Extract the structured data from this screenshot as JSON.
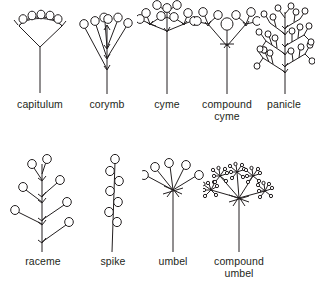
{
  "figure": {
    "background_color": "#ffffff",
    "ink_color": "#231f20",
    "rows": [
      {
        "row_name": "top-row",
        "items": [
          {
            "id": "capitulum",
            "label": "capitulum",
            "icon": "capitulum-diagram",
            "label_lines": 1
          },
          {
            "id": "corymb",
            "label": "corymb",
            "icon": "corymb-diagram",
            "label_lines": 1
          },
          {
            "id": "cyme",
            "label": "cyme",
            "icon": "cyme-diagram",
            "label_lines": 1
          },
          {
            "id": "compound-cyme",
            "label": "compound\ncyme",
            "icon": "compound-cyme-diagram",
            "label_lines": 2
          },
          {
            "id": "panicle",
            "label": "panicle",
            "icon": "panicle-diagram",
            "label_lines": 1
          }
        ]
      },
      {
        "row_name": "bottom-row",
        "items": [
          {
            "id": "raceme",
            "label": "raceme",
            "icon": "raceme-diagram",
            "label_lines": 1
          },
          {
            "id": "spike",
            "label": "spike",
            "icon": "spike-diagram",
            "label_lines": 1
          },
          {
            "id": "umbel",
            "label": "umbel",
            "icon": "umbel-diagram",
            "label_lines": 1
          },
          {
            "id": "compound-umbel",
            "label": "compound\numbel",
            "icon": "compound-umbel-diagram",
            "label_lines": 2
          }
        ]
      }
    ]
  }
}
